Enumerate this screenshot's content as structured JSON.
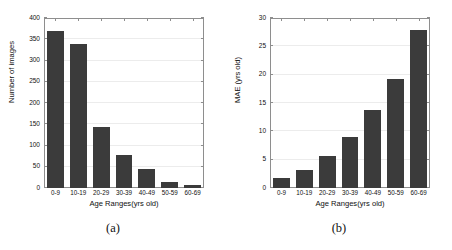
{
  "figure": {
    "panels": [
      {
        "caption": "(a)",
        "chart_data": {
          "type": "bar",
          "title": "",
          "categories": [
            "0-9",
            "10-19",
            "20-29",
            "30-39",
            "40-49",
            "50-59",
            "60-69"
          ],
          "values": [
            370,
            338,
            143,
            78,
            45,
            14,
            6
          ],
          "xlabel": "Age Ranges(yrs old)",
          "ylabel": "Number of images",
          "ylim": [
            0,
            400
          ],
          "yticks": [
            0,
            50,
            100,
            150,
            200,
            250,
            300,
            350,
            400
          ],
          "ytick_labels": [
            "0",
            "50",
            "100",
            "150",
            "200",
            "250",
            "300",
            "350",
            "400"
          ],
          "grid": true,
          "legend": "none",
          "bar_color": "#3b3b3b"
        }
      },
      {
        "caption": "(b)",
        "chart_data": {
          "type": "bar",
          "title": "",
          "categories": [
            "0-9",
            "10-19",
            "20-29",
            "30-39",
            "40-49",
            "50-59",
            "60-69"
          ],
          "values": [
            1.7,
            3.2,
            5.6,
            9.0,
            13.7,
            19.2,
            27.8
          ],
          "xlabel": "Age Ranges(yrs old)",
          "ylabel": "MAE (yrs old)",
          "ylim": [
            0,
            30
          ],
          "yticks": [
            0,
            5,
            10,
            15,
            20,
            25,
            30
          ],
          "ytick_labels": [
            "0",
            "5",
            "10",
            "15",
            "20",
            "25",
            "30"
          ],
          "grid": true,
          "legend": "none",
          "bar_color": "#3b3b3b"
        }
      }
    ]
  },
  "colors": {
    "bar": "#3b3b3b",
    "frame": "#8e8e8e",
    "grid": "#ececec",
    "background": "#ffffff",
    "text": "#111111"
  }
}
